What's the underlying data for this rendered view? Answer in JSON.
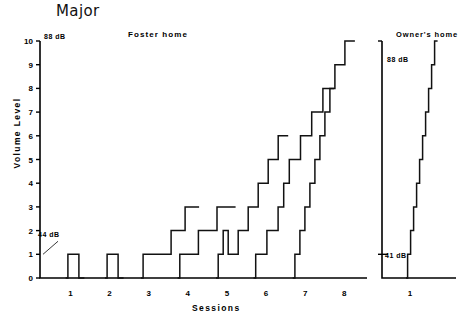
{
  "chart_data": {
    "type": "line",
    "title": "Major",
    "xlabel": "Sessions",
    "ylabel": "Volume Level",
    "ylim": [
      0,
      10
    ],
    "grid": false,
    "legend": "none",
    "yticks": [
      "0",
      "1",
      "2",
      "3",
      "4",
      "5",
      "6",
      "7",
      "8",
      "9",
      "10"
    ],
    "annotations": [
      {
        "text": "88 dB",
        "panel": "left",
        "level": 10
      },
      {
        "text": "44 dB",
        "panel": "left",
        "level": 1
      },
      {
        "text": "88 dB",
        "panel": "right",
        "level": 10
      },
      {
        "text": "41 dB",
        "panel": "right",
        "level": 1
      }
    ],
    "panels": [
      {
        "name": "Foster home",
        "xticks": [
          "1",
          "2",
          "3",
          "4",
          "5",
          "6",
          "7",
          "8"
        ],
        "series": [
          {
            "name": "session-1",
            "steps": [
              0,
              1,
              1,
              0
            ]
          },
          {
            "name": "session-2",
            "steps": [
              0,
              1,
              1,
              0
            ]
          },
          {
            "name": "session-3",
            "steps": [
              0,
              1,
              1,
              1,
              1,
              2,
              2,
              3,
              3
            ]
          },
          {
            "name": "session-4",
            "steps": [
              0,
              1,
              1,
              1,
              2,
              2,
              2,
              3,
              3,
              3
            ]
          },
          {
            "name": "session-5",
            "steps": [
              0,
              1,
              2,
              1,
              1,
              2,
              2,
              3,
              3,
              4,
              4,
              5,
              5,
              6,
              6
            ]
          },
          {
            "name": "session-6",
            "steps": [
              0,
              1,
              1,
              2,
              2,
              3,
              4,
              5,
              5,
              6,
              6,
              7,
              7,
              8,
              8
            ]
          },
          {
            "name": "session-7",
            "steps": [
              0,
              1,
              2,
              3,
              4,
              5,
              6,
              7,
              8,
              9,
              9,
              10,
              10
            ]
          }
        ]
      },
      {
        "name": "Owner's home",
        "xticks": [
          "1"
        ],
        "series": [
          {
            "name": "owner-session-1",
            "steps": [
              0,
              1,
              2,
              3,
              4,
              5,
              6,
              7,
              8,
              9,
              10
            ]
          }
        ]
      }
    ]
  },
  "header": {
    "title": "Major"
  },
  "panel_labels": {
    "left": "Foster home",
    "right": "Owner's home"
  },
  "axis_labels": {
    "y": "Volume Level",
    "x": "Sessions"
  },
  "db_labels": {
    "left_top": "88 dB",
    "left_mid": "44 dB",
    "right_top": "88 dB",
    "right_bottom": "41 dB"
  }
}
